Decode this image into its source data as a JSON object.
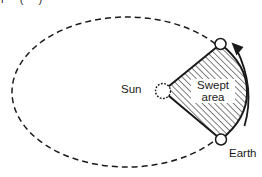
{
  "diagram": {
    "cropped_text_fragment": "r ( )",
    "labels": {
      "sun": "Sun",
      "swept_line1": "Swept",
      "swept_line2": "area",
      "earth": "Earth"
    },
    "icons": {
      "sun": "sun-circle-dotted-edge",
      "earth_top": "planet-position-circle",
      "earth_bottom": "planet-position-circle",
      "direction_arrow": "curved-arrow-counterclockwise"
    },
    "colors": {
      "ink": "#1a1a1a",
      "background": "#ffffff"
    }
  }
}
